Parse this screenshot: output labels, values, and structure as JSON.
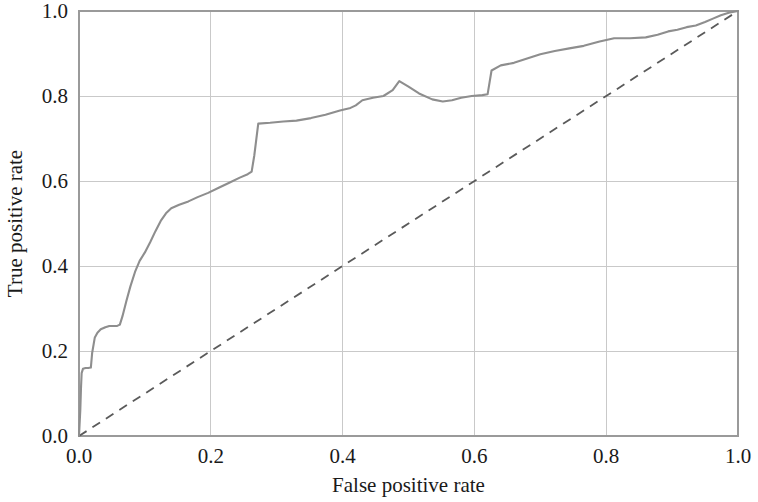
{
  "chart_data": {
    "type": "line",
    "title": "",
    "xlabel": "False positive rate",
    "ylabel": "True positive rate",
    "xlim": [
      0.0,
      1.0
    ],
    "ylim": [
      0.0,
      1.0
    ],
    "xticks": [
      "0.0",
      "0.2",
      "0.4",
      "0.6",
      "0.8",
      "1.0"
    ],
    "xtick_values": [
      0.0,
      0.2,
      0.4,
      0.6,
      0.8,
      1.0
    ],
    "yticks": [
      "0.0",
      "0.2",
      "0.4",
      "0.6",
      "0.8",
      "1.0"
    ],
    "ytick_values": [
      0.0,
      0.2,
      0.4,
      0.6,
      0.8,
      1.0
    ],
    "grid": true,
    "legend": "none",
    "colors": {
      "roc_curve": "#8e8e8e",
      "chance_line": "#5a5a5a",
      "gridline": "#c9c9c9",
      "axis": "#9a9a9a",
      "background": "#ffffff",
      "text": "#1a1a1a"
    },
    "series": [
      {
        "name": "ROC curve",
        "style": "solid",
        "color": "#8e8e8e",
        "x": [
          0.0,
          0.002,
          0.003,
          0.004,
          0.006,
          0.01,
          0.014,
          0.018,
          0.02,
          0.024,
          0.028,
          0.033,
          0.04,
          0.046,
          0.052,
          0.058,
          0.062,
          0.066,
          0.072,
          0.078,
          0.085,
          0.092,
          0.1,
          0.108,
          0.116,
          0.124,
          0.132,
          0.14,
          0.152,
          0.166,
          0.18,
          0.196,
          0.212,
          0.228,
          0.244,
          0.256,
          0.262,
          0.266,
          0.272,
          0.29,
          0.31,
          0.33,
          0.352,
          0.374,
          0.396,
          0.412,
          0.42,
          0.43,
          0.446,
          0.462,
          0.476,
          0.486,
          0.5,
          0.516,
          0.536,
          0.552,
          0.566,
          0.58,
          0.596,
          0.612,
          0.62,
          0.626,
          0.64,
          0.66,
          0.68,
          0.7,
          0.722,
          0.744,
          0.766,
          0.79,
          0.812,
          0.836,
          0.86,
          0.878,
          0.894,
          0.908,
          0.922,
          0.936,
          0.95,
          0.962,
          0.974,
          0.986,
          1.0
        ],
        "y": [
          0.0,
          0.062,
          0.112,
          0.148,
          0.158,
          0.16,
          0.16,
          0.161,
          0.196,
          0.232,
          0.243,
          0.251,
          0.256,
          0.259,
          0.259,
          0.259,
          0.262,
          0.282,
          0.318,
          0.352,
          0.386,
          0.412,
          0.432,
          0.456,
          0.482,
          0.506,
          0.524,
          0.536,
          0.544,
          0.552,
          0.562,
          0.572,
          0.584,
          0.596,
          0.608,
          0.616,
          0.622,
          0.66,
          0.735,
          0.737,
          0.74,
          0.742,
          0.748,
          0.756,
          0.766,
          0.772,
          0.778,
          0.79,
          0.796,
          0.8,
          0.814,
          0.835,
          0.822,
          0.806,
          0.792,
          0.787,
          0.79,
          0.796,
          0.8,
          0.802,
          0.804,
          0.86,
          0.872,
          0.878,
          0.888,
          0.898,
          0.906,
          0.912,
          0.918,
          0.928,
          0.936,
          0.936,
          0.938,
          0.944,
          0.952,
          0.956,
          0.962,
          0.966,
          0.974,
          0.982,
          0.99,
          0.996,
          1.0
        ]
      },
      {
        "name": "Chance level",
        "style": "dashed",
        "color": "#5a5a5a",
        "x": [
          0.0,
          1.0
        ],
        "y": [
          0.0,
          1.0
        ]
      }
    ],
    "annotations": []
  },
  "axes": {
    "x_axis_title": "False positive rate",
    "y_axis_title": "True positive rate"
  }
}
